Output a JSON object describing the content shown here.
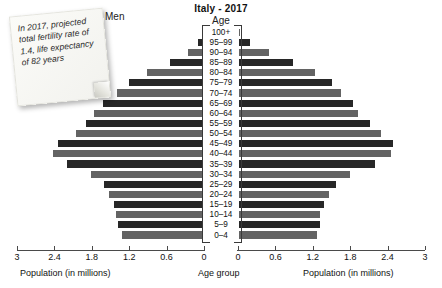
{
  "chart_data": {
    "type": "bar",
    "title": "Italy - 2017",
    "center_axis_title": "Age",
    "xlabel_left": "Population (in millions)",
    "xlabel_right": "Population (in millions)",
    "xlabel_center": "Age group",
    "left_series_label": "Men",
    "grid": false,
    "legend": "none",
    "xlim": [
      0,
      3
    ],
    "ticks": [
      3,
      2.4,
      1.8,
      1.2,
      0.6,
      0
    ],
    "ticks_right": [
      0,
      0.6,
      1.2,
      1.8,
      2.4,
      3
    ],
    "categories": [
      "100+",
      "95–99",
      "90–94",
      "85–89",
      "80–84",
      "75–79",
      "70–74",
      "65–69",
      "60–64",
      "55–59",
      "50–54",
      "45–49",
      "40–44",
      "35–39",
      "30–34",
      "25–29",
      "20–24",
      "15–19",
      "10–14",
      "5–9",
      "0–4"
    ],
    "series": [
      {
        "name": "Men",
        "side": "left",
        "values": [
          0.02,
          0.09,
          0.26,
          0.55,
          0.92,
          1.2,
          1.4,
          1.62,
          1.76,
          1.9,
          2.05,
          2.35,
          2.42,
          2.2,
          1.82,
          1.6,
          1.52,
          1.45,
          1.42,
          1.38,
          1.32
        ]
      },
      {
        "name": "Women",
        "side": "right",
        "values": [
          0.04,
          0.2,
          0.5,
          0.88,
          1.24,
          1.5,
          1.65,
          1.85,
          1.93,
          2.12,
          2.3,
          2.48,
          2.46,
          2.2,
          1.8,
          1.58,
          1.46,
          1.38,
          1.32,
          1.32,
          1.26
        ]
      }
    ]
  },
  "annotation": {
    "sticky_note": "In 2017, projected total fertility rate of 1.4, life expectancy of 82 years"
  },
  "colors": {
    "bar_light": "#636363",
    "bar_dark": "#272727",
    "text": "#1a1a1a",
    "axis": "#4a4a4a",
    "note_bg": "#fbfbf8"
  }
}
